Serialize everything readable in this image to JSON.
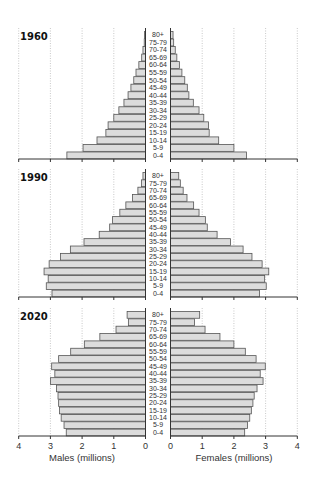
{
  "chart_data": {
    "type": "bar",
    "subtype": "population-pyramid",
    "title": "",
    "age_groups": [
      "0-4",
      "5-9",
      "10-14",
      "15-19",
      "20-24",
      "25-29",
      "30-34",
      "35-39",
      "40-44",
      "45-49",
      "50-54",
      "55-59",
      "60-64",
      "65-69",
      "70-74",
      "75-79",
      "80+"
    ],
    "xlabel_left": "Males (millions)",
    "xlabel_right": "Females (millions)",
    "xticks": [
      0,
      1,
      2,
      3,
      4
    ],
    "xlim": [
      0,
      4
    ],
    "grid": true,
    "panels": [
      {
        "year": "1960",
        "males": [
          2.48,
          1.97,
          1.53,
          1.25,
          1.18,
          1.0,
          0.84,
          0.68,
          0.55,
          0.46,
          0.37,
          0.3,
          0.21,
          0.12,
          0.08,
          0.04,
          0.03
        ],
        "females": [
          2.4,
          2.0,
          1.52,
          1.22,
          1.2,
          1.05,
          0.9,
          0.72,
          0.58,
          0.53,
          0.45,
          0.36,
          0.28,
          0.2,
          0.15,
          0.1,
          0.08
        ]
      },
      {
        "year": "1990",
        "males": [
          2.95,
          3.13,
          3.07,
          3.2,
          3.04,
          2.68,
          2.37,
          1.94,
          1.46,
          1.13,
          1.04,
          0.81,
          0.62,
          0.41,
          0.24,
          0.13,
          0.08
        ],
        "females": [
          2.81,
          3.02,
          2.97,
          3.1,
          2.89,
          2.57,
          2.29,
          1.89,
          1.47,
          1.16,
          1.1,
          0.9,
          0.73,
          0.52,
          0.4,
          0.31,
          0.26
        ]
      },
      {
        "year": "2020",
        "males": [
          2.5,
          2.57,
          2.66,
          2.71,
          2.74,
          2.76,
          2.81,
          3.0,
          2.86,
          2.96,
          2.74,
          2.36,
          1.93,
          1.44,
          0.93,
          0.54,
          0.58
        ],
        "females": [
          2.34,
          2.43,
          2.5,
          2.55,
          2.6,
          2.64,
          2.73,
          2.92,
          2.83,
          2.99,
          2.7,
          2.36,
          2.0,
          1.56,
          1.09,
          0.76,
          0.92
        ]
      }
    ]
  },
  "axis": {
    "left_ticks": [
      "4",
      "3",
      "2",
      "1",
      "0"
    ],
    "right_ticks": [
      "0",
      "1",
      "2",
      "3",
      "4"
    ],
    "left_title": "Males (millions)",
    "right_title": "Females (millions)"
  },
  "colors": {
    "bar_fill": "#dcdcdc",
    "bar_stroke": "#555555",
    "grid": "#bbbbbb",
    "axis": "#333333"
  }
}
